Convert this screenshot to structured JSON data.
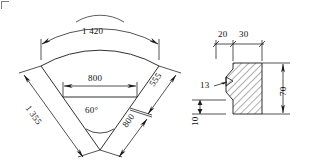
{
  "drawing": {
    "title": "Engineering dimension drawing",
    "line_color": "#1a1a1a",
    "hatch_color": "#1a1a1a",
    "background": "#ffffff",
    "units_note": ""
  },
  "sector_view": {
    "name": "annular-sector-plan-view",
    "apex_angle_label": "60°",
    "outer_arc_dimension": "1 420",
    "left_side_dimension": "1 355",
    "inner_chord_dimension": "800",
    "right_outer_segment_dimension": "555",
    "right_inner_segment_dimension": "800"
  },
  "section_view": {
    "name": "profile-cross-section-detail",
    "top_dimension_left": "20",
    "top_dimension_right": "30",
    "notch_leader_label": "13",
    "height_dimension": "70",
    "base_thickness_dimension": "10"
  }
}
